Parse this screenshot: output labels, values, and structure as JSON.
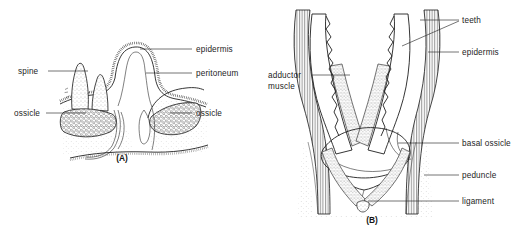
{
  "figure": {
    "background_color": "#ffffff",
    "ink_color": "#1f1f1f"
  },
  "panels": [
    {
      "id": "A",
      "caption": "(A)",
      "caption_pos": {
        "x": 122,
        "y": 161
      },
      "labels": [
        {
          "key": "spine",
          "text": "spine",
          "text_pos": {
            "x": 18,
            "y": 74
          },
          "anchor": "start",
          "leader": [
            [
              48,
              71
            ],
            [
              88,
              71
            ]
          ]
        },
        {
          "key": "ossicle_left",
          "text": "ossicle",
          "text_pos": {
            "x": 14,
            "y": 116
          },
          "anchor": "start",
          "leader": [
            [
              48,
              113
            ],
            [
              86,
              113
            ]
          ]
        },
        {
          "key": "epidermis",
          "text": "epidermis",
          "text_pos": {
            "x": 196,
            "y": 52
          },
          "anchor": "start",
          "leader": [
            [
              192,
              49
            ],
            [
              140,
              49
            ]
          ]
        },
        {
          "key": "peritoneum",
          "text": "peritoneum",
          "text_pos": {
            "x": 196,
            "y": 76
          },
          "anchor": "start",
          "leader": [
            [
              192,
              73
            ],
            [
              144,
              73
            ]
          ]
        },
        {
          "key": "ossicle_right",
          "text": "ossicle",
          "text_pos": {
            "x": 196,
            "y": 116
          },
          "anchor": "start",
          "leader": [
            [
              192,
              113
            ],
            [
              168,
              113
            ]
          ]
        }
      ]
    },
    {
      "id": "B",
      "caption": "(B)",
      "caption_pos": {
        "x": 372,
        "y": 223
      },
      "labels": [
        {
          "key": "teeth",
          "text": "teeth",
          "text_pos": {
            "x": 462,
            "y": 23
          },
          "anchor": "start",
          "leader": [
            [
              459,
              20
            ],
            [
              418,
              20
            ]
          ],
          "leader2": [
            [
              459,
              21
            ],
            [
              404,
              45
            ]
          ]
        },
        {
          "key": "epidermis",
          "text": "epidermis",
          "text_pos": {
            "x": 462,
            "y": 55
          },
          "anchor": "start",
          "leader": [
            [
              459,
              52
            ],
            [
              424,
              52
            ]
          ]
        },
        {
          "key": "adductor_muscle",
          "text": "adductor",
          "text2": "muscle",
          "text_pos": {
            "x": 268,
            "y": 78
          },
          "text2_pos": {
            "x": 268,
            "y": 89
          },
          "anchor": "start",
          "leader": [
            [
              312,
              75
            ],
            [
              352,
              75
            ]
          ]
        },
        {
          "key": "basal_ossicle",
          "text": "basal ossicle",
          "text_pos": {
            "x": 462,
            "y": 146
          },
          "anchor": "start",
          "leader": [
            [
              459,
              143
            ],
            [
              400,
              143
            ]
          ]
        },
        {
          "key": "peduncle",
          "text": "peduncle",
          "text_pos": {
            "x": 462,
            "y": 178
          },
          "anchor": "start",
          "leader": [
            [
              459,
              175
            ],
            [
              424,
              175
            ]
          ]
        },
        {
          "key": "ligament",
          "text": "ligament",
          "text_pos": {
            "x": 462,
            "y": 204
          },
          "anchor": "start",
          "leader": [
            [
              459,
              201
            ],
            [
              370,
              201
            ]
          ]
        }
      ]
    }
  ]
}
